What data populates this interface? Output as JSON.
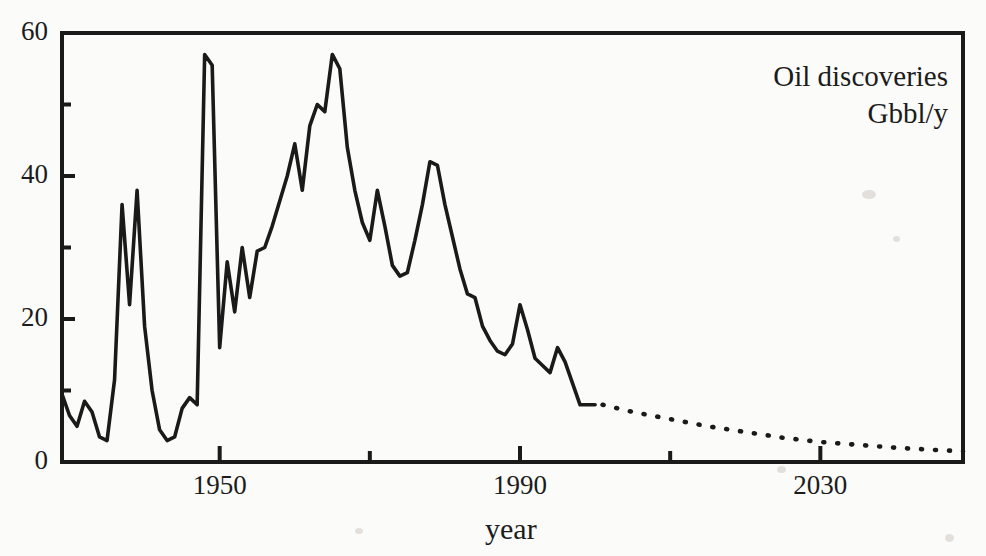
{
  "chart_data": {
    "type": "line",
    "title": "Oil discoveries",
    "subtitle": "Gbbl/y",
    "xlabel": "year",
    "ylabel": "",
    "xlim": [
      1929,
      2049
    ],
    "ylim": [
      0,
      60
    ],
    "grid": false,
    "legend": null,
    "xticks_major": [
      1950,
      1990,
      2030
    ],
    "xticks_minor": [
      1970,
      2010
    ],
    "xtick_labels": [
      "1950",
      "1990",
      "2030"
    ],
    "yticks_major": [
      0,
      20,
      40,
      60
    ],
    "yticks_minor": [
      10,
      30,
      50
    ],
    "ytick_labels": [
      "0",
      "20",
      "40",
      "60"
    ],
    "series": [
      {
        "name": "historical discoveries",
        "style": "solid",
        "x": [
          1929,
          1930,
          1931,
          1932,
          1933,
          1934,
          1935,
          1936,
          1937,
          1938,
          1939,
          1940,
          1941,
          1942,
          1943,
          1944,
          1945,
          1946,
          1947,
          1948,
          1949,
          1950,
          1951,
          1952,
          1953,
          1954,
          1955,
          1956,
          1957,
          1958,
          1959,
          1960,
          1961,
          1962,
          1963,
          1964,
          1965,
          1966,
          1967,
          1968,
          1969,
          1970,
          1971,
          1972,
          1973,
          1974,
          1975,
          1976,
          1977,
          1978,
          1979,
          1980,
          1981,
          1982,
          1983,
          1984,
          1985,
          1986,
          1987,
          1988,
          1989,
          1990,
          1991,
          1992,
          1993,
          1994,
          1995,
          1996,
          1997,
          1998,
          1999,
          2000
        ],
        "y": [
          9.5,
          6.5,
          5.0,
          8.5,
          7.0,
          3.5,
          3.0,
          11.5,
          36.0,
          22.0,
          38.0,
          19.0,
          10.0,
          4.5,
          3.0,
          3.5,
          7.5,
          9.0,
          8.0,
          57.0,
          55.5,
          16.0,
          28.0,
          21.0,
          30.0,
          23.0,
          29.5,
          30.0,
          33.0,
          36.5,
          40.0,
          44.5,
          38.0,
          47.0,
          50.0,
          49.0,
          57.0,
          55.0,
          44.0,
          38.0,
          33.5,
          31.0,
          38.0,
          33.0,
          27.5,
          26.0,
          26.5,
          31.0,
          36.0,
          42.0,
          41.5,
          36.0,
          31.5,
          27.0,
          23.5,
          23.0,
          19.0,
          17.0,
          15.5,
          15.0,
          16.5,
          22.0,
          18.5,
          14.5,
          13.5,
          12.5,
          16.0,
          14.0,
          11.0,
          8.0,
          8.0,
          8.0
        ]
      },
      {
        "name": "projected discoveries",
        "style": "dotted",
        "x": [
          2001,
          2005,
          2010,
          2015,
          2020,
          2025,
          2030,
          2035,
          2040,
          2045,
          2049
        ],
        "y": [
          8.0,
          7.0,
          6.0,
          5.0,
          4.2,
          3.4,
          2.8,
          2.4,
          2.0,
          1.7,
          1.5
        ]
      }
    ]
  },
  "annotation": {
    "line1": "Oil discoveries",
    "line2": "Gbbl/y"
  },
  "axis": {
    "x_title": "year"
  },
  "colors": {
    "line": "#1a1a1a",
    "axis": "#1a1a1a",
    "background": "#fbfbf9"
  }
}
